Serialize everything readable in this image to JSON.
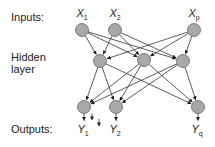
{
  "labels": {
    "inputs": "Inputs:",
    "hidden": "Hidden\nlayer",
    "outputs": "Outputs:"
  },
  "layers": {
    "inputs": [
      {
        "name": "X",
        "sub": "1"
      },
      {
        "name": "X",
        "sub": "2"
      },
      {
        "name": "X",
        "sub": "p"
      }
    ],
    "hidden": [
      {
        "id": "h1"
      },
      {
        "id": "h2"
      },
      {
        "id": "h3"
      }
    ],
    "outputs": [
      {
        "name": "Y",
        "sub": "1"
      },
      {
        "name": "Y",
        "sub": "2"
      },
      {
        "name": "Y",
        "sub": "q"
      }
    ]
  },
  "colors": {
    "node_fill": "#a8a8a8",
    "node_stroke": "#555555",
    "edge": "#333333"
  }
}
